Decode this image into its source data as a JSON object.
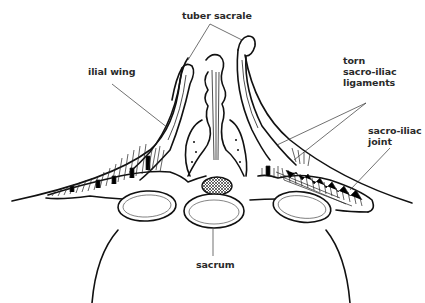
{
  "diagram": {
    "labels": {
      "tuber_sacrale": "tuber sacrale",
      "ilial_wing": "ilial wing",
      "torn_ligaments_line1": "torn",
      "torn_ligaments_line2": "sacro-iliac",
      "torn_ligaments_line3": "ligaments",
      "sacroiliac_joint_line1": "sacro-iliac",
      "sacroiliac_joint_line2": "joint",
      "sacrum": "sacrum"
    },
    "colors": {
      "ink": "#111111",
      "background": "#ffffff",
      "label": "#2a2a2a"
    }
  }
}
